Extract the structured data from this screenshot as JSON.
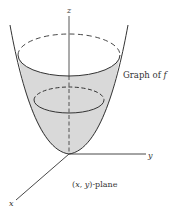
{
  "diagram": {
    "type": "3d-surface-paraboloid",
    "colors": {
      "surface_fill": "#d9d9d9",
      "line": "#333333",
      "background": "#ffffff"
    },
    "axes": {
      "z_label": "z",
      "y_label": "y",
      "x_label": "x"
    },
    "labels": {
      "graph": "Graph of f",
      "graph_prefix": "Graph of ",
      "graph_fn": "f",
      "plane": "(x, y)-plane",
      "plane_open": "(",
      "plane_x": "x",
      "plane_sep": ", ",
      "plane_y": "y",
      "plane_rest": ")-plane"
    }
  }
}
